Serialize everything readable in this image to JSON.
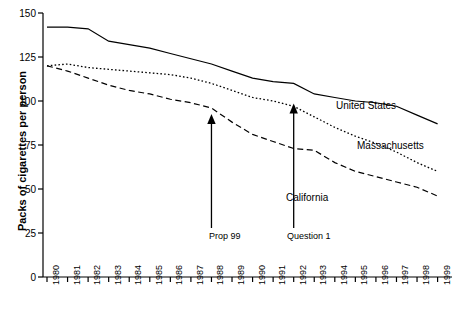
{
  "chart_data": {
    "type": "line",
    "title": "",
    "xlabel": "",
    "ylabel": "Packs of cigarettes per person",
    "ylim": [
      0,
      150
    ],
    "yticks": [
      0,
      25,
      50,
      75,
      100,
      125,
      150
    ],
    "grid": false,
    "legend_position": "inline-right",
    "categories": [
      "1980",
      "1981",
      "1982",
      "1983",
      "1984",
      "1985",
      "1986",
      "1987",
      "1988",
      "1989",
      "1990",
      "1991",
      "1992",
      "1993",
      "1994",
      "1995",
      "1996",
      "1997",
      "1998",
      "1999"
    ],
    "series": [
      {
        "name": "United States",
        "style": "solid",
        "values": [
          142,
          142,
          141,
          134,
          132,
          130,
          127,
          124,
          121,
          117,
          113,
          111,
          110,
          104,
          102,
          100,
          99,
          97,
          92,
          87
        ]
      },
      {
        "name": "Massachusetts",
        "style": "dotted",
        "values": [
          120,
          121,
          119,
          118,
          117,
          116,
          115,
          113,
          110,
          106,
          102,
          100,
          97,
          91,
          85,
          80,
          76,
          71,
          65,
          60
        ]
      },
      {
        "name": "California",
        "style": "dashed",
        "values": [
          120,
          117,
          113,
          109,
          106,
          104,
          101,
          99,
          96,
          88,
          81,
          77,
          73,
          72,
          65,
          60,
          57,
          54,
          51,
          46
        ]
      }
    ],
    "annotations": [
      {
        "label": "Prop 99",
        "x_year": "1988",
        "y_value": 92
      },
      {
        "label": "Question 1",
        "x_year": "1992",
        "y_value": 98
      }
    ]
  }
}
